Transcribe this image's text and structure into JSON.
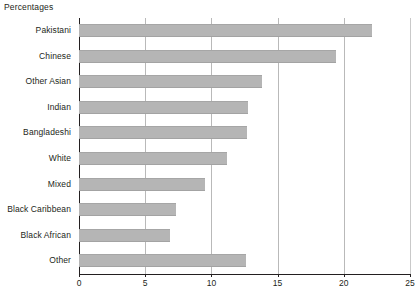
{
  "title": "Percentages",
  "chart_data": {
    "type": "bar",
    "orientation": "horizontal",
    "title": "Percentages",
    "xlabel": "",
    "ylabel": "",
    "xlim": [
      0,
      25
    ],
    "xticks": [
      0,
      5,
      10,
      15,
      20,
      25
    ],
    "xtick_labels": [
      "0",
      "5",
      "10",
      "15",
      "20",
      "25"
    ],
    "grid": "vertical",
    "legend": "none",
    "bar_color": "#b5b5b5",
    "categories": [
      "Pakistani",
      "Chinese",
      "Other Asian",
      "Indian",
      "Bangladeshi",
      "White",
      "Mixed",
      "Black Caribbean",
      "Black African",
      "Other"
    ],
    "values": [
      22.1,
      19.4,
      13.8,
      12.8,
      12.7,
      11.2,
      9.5,
      7.3,
      6.9,
      12.6
    ]
  }
}
